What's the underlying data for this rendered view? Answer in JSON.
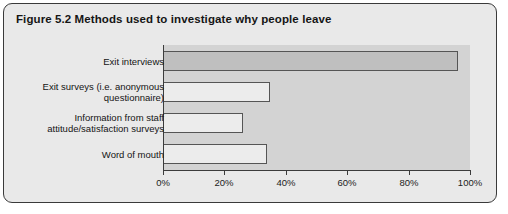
{
  "figure": {
    "title": "Figure 5.2  Methods used to investigate why people leave",
    "border_color": "#3a3a3a",
    "background_color": "#e9e9e9"
  },
  "chart_data": {
    "type": "bar",
    "orientation": "horizontal",
    "title": "Figure 5.2  Methods used to investigate why people leave",
    "xlabel": "",
    "ylabel": "",
    "xlim": [
      0,
      100
    ],
    "grid": false,
    "legend": "none",
    "plot_background_color": "#d3d3d3",
    "categories": [
      "Exit interviews",
      "Exit surveys (i.e. anonymous questionnaire)",
      "Information from staff attitude/satisfaction surveys",
      "Word of mouth"
    ],
    "category_lines": [
      [
        "Exit interviews"
      ],
      [
        "Exit surveys (i.e. anonymous",
        "questionnaire)"
      ],
      [
        "Information from staff",
        "attitude/satisfaction surveys"
      ],
      [
        "Word of mouth"
      ]
    ],
    "values": [
      96,
      35,
      26,
      34
    ],
    "bar_colors": [
      "#bfbfbf",
      "#ececec",
      "#ececec",
      "#ececec"
    ],
    "tick_values": [
      0,
      20,
      40,
      60,
      80,
      100
    ],
    "tick_labels": [
      "0%",
      "20%",
      "40%",
      "60%",
      "80%",
      "100%"
    ]
  }
}
